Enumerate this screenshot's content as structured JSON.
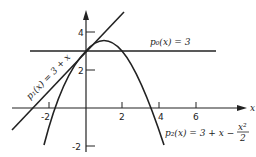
{
  "diagram": {
    "type": "function-plot",
    "axes": {
      "x_label": "x",
      "x_ticks": [
        "-2",
        "2",
        "4",
        "6"
      ],
      "y_ticks": [
        "4",
        "2",
        "-2"
      ]
    },
    "curves": [
      {
        "name": "p0",
        "label": "p₀(x) = 3",
        "expr": "3"
      },
      {
        "name": "p1",
        "label": "p₁(x) = 3 + x",
        "expr": "3 + x"
      },
      {
        "name": "p2",
        "label_main": "p₂(x) = 3 + x −",
        "label_num": "x²",
        "label_den": "2",
        "expr": "3 + x - x^2/2"
      }
    ],
    "colors": {
      "stroke": "#222222",
      "background": "#ffffff"
    }
  }
}
